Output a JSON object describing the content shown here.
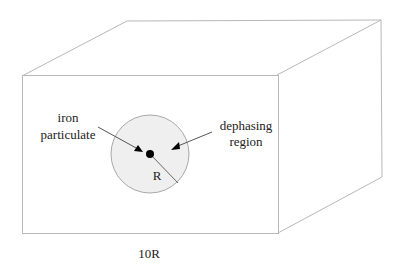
{
  "diagram": {
    "type": "3d-box-schematic",
    "colors": {
      "box_edge": "#b8b8b8",
      "sphere_fill": "#efefef",
      "sphere_edge": "#a8a8a8",
      "particle": "#000000",
      "arrow": "#555555",
      "text": "#222222"
    },
    "box": {
      "front": {
        "x1": 22,
        "y1": 76,
        "x2": 278,
        "y2": 234
      },
      "back_offset": {
        "dx": 104,
        "dy": -56
      }
    },
    "sphere": {
      "cx": 150,
      "cy": 154,
      "r": 39
    },
    "particle": {
      "cx": 150,
      "cy": 154,
      "r": 4
    },
    "labels": {
      "iron_line1": "iron",
      "iron_line2": "particulate",
      "dephasing_line1": "dephasing",
      "dephasing_line2": "region",
      "radius": "R",
      "box_dimension": "10R"
    }
  }
}
